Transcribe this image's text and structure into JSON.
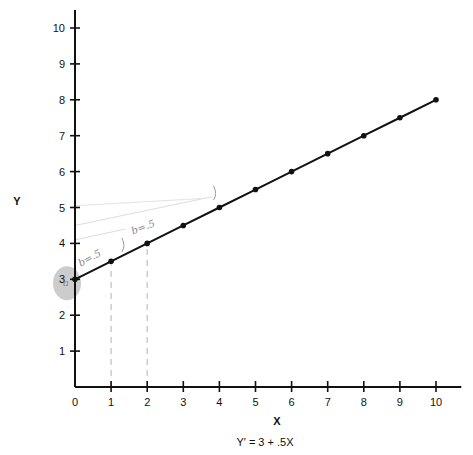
{
  "chart_data": {
    "type": "line",
    "title": "",
    "caption": "Y′ = 3 + .5X",
    "xlabel": "X",
    "ylabel": "Y",
    "xlim": [
      0,
      10
    ],
    "ylim": [
      0,
      10
    ],
    "x_ticks": [
      0,
      1,
      2,
      3,
      4,
      5,
      6,
      7,
      8,
      9,
      10
    ],
    "y_ticks": [
      1,
      2,
      3,
      4,
      5,
      6,
      7,
      8,
      9,
      10
    ],
    "grid": false,
    "series": [
      {
        "name": "Y′ = 3 + .5X",
        "x": [
          0,
          1,
          2,
          3,
          4,
          5,
          6,
          7,
          8,
          9,
          10
        ],
        "y": [
          3,
          3.5,
          4,
          4.5,
          5,
          5.5,
          6,
          6.5,
          7,
          7.5,
          8
        ],
        "color": "#111111"
      }
    ],
    "annotations": [
      {
        "text": "b=.5",
        "note": "handwritten pencil near x=0..1"
      },
      {
        "text": "b=.5",
        "note": "handwritten pencil near x=2..3"
      },
      {
        "text": "a",
        "note": "shaded circle highlighting intercept at y=3"
      }
    ],
    "guides": [
      {
        "type": "dashed-vertical",
        "x": 1,
        "from_y": 0,
        "to_y": 3.5,
        "color": "#cccccc"
      },
      {
        "type": "dashed-vertical",
        "x": 2,
        "from_y": 0,
        "to_y": 4,
        "color": "#cccccc"
      }
    ]
  }
}
